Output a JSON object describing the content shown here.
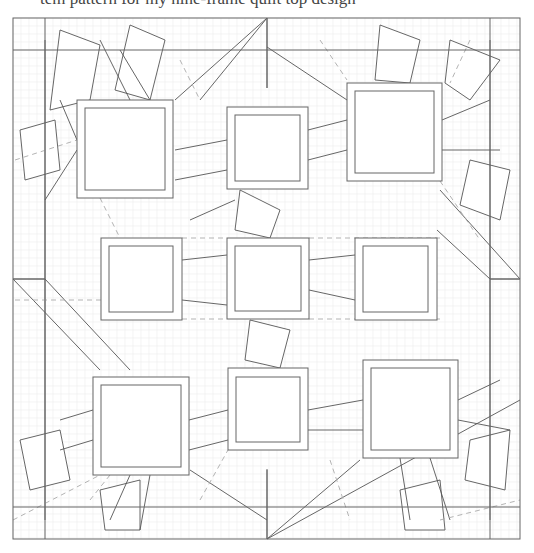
{
  "caption": "tem pattern for my nine-frame quilt top design",
  "frame": {
    "outer": [
      13,
      18,
      520,
      539
    ],
    "inner_v": [
      45,
      490
    ],
    "inner_h": [
      50,
      507
    ],
    "mid_h": 279,
    "mid_v": 267
  },
  "squares": [
    {
      "name": "top-left",
      "outer": [
        77,
        100,
        173,
        198
      ],
      "inner": [
        85,
        108,
        165,
        190
      ]
    },
    {
      "name": "top-middle",
      "outer": [
        227,
        107,
        308,
        189
      ],
      "inner": [
        235,
        115,
        300,
        181
      ]
    },
    {
      "name": "top-right",
      "outer": [
        347,
        83,
        442,
        181
      ],
      "inner": [
        355,
        91,
        434,
        173
      ]
    },
    {
      "name": "middle-left",
      "outer": [
        101,
        238,
        182,
        320
      ],
      "inner": [
        109,
        246,
        173,
        312
      ]
    },
    {
      "name": "center",
      "outer": [
        227,
        238,
        309,
        319
      ],
      "inner": [
        235,
        246,
        301,
        311
      ]
    },
    {
      "name": "middle-right",
      "outer": [
        355,
        238,
        437,
        320
      ],
      "inner": [
        363,
        246,
        428,
        312
      ]
    },
    {
      "name": "bottom-left",
      "outer": [
        93,
        377,
        189,
        475
      ],
      "inner": [
        101,
        385,
        181,
        467
      ]
    },
    {
      "name": "bottom-middle",
      "outer": [
        228,
        368,
        308,
        450
      ],
      "inner": [
        236,
        377,
        300,
        442
      ]
    },
    {
      "name": "bottom-right",
      "outer": [
        363,
        360,
        458,
        458
      ],
      "inner": [
        371,
        368,
        450,
        450
      ]
    }
  ],
  "lines": [
    [
      267,
      18,
      267,
      88
    ],
    [
      267,
      18,
      175,
      100
    ],
    [
      267,
      47,
      347,
      100
    ],
    [
      267,
      18,
      200,
      100
    ],
    [
      267,
      470,
      267,
      539
    ],
    [
      267,
      539,
      360,
      460
    ],
    [
      267,
      539,
      520,
      400
    ],
    [
      267,
      520,
      190,
      470
    ],
    [
      13,
      279,
      45,
      279
    ],
    [
      13,
      279,
      100,
      370
    ],
    [
      45,
      279,
      130,
      370
    ],
    [
      490,
      279,
      520,
      279
    ],
    [
      520,
      279,
      440,
      190
    ],
    [
      490,
      279,
      437,
      230
    ],
    [
      45,
      40,
      45,
      279
    ],
    [
      45,
      279,
      45,
      520
    ],
    [
      490,
      40,
      490,
      279
    ],
    [
      490,
      279,
      490,
      520
    ],
    [
      45,
      200,
      77,
      150
    ],
    [
      60,
      100,
      77,
      140
    ],
    [
      100,
      40,
      130,
      100
    ],
    [
      120,
      50,
      150,
      100
    ],
    [
      175,
      150,
      227,
      140
    ],
    [
      175,
      180,
      227,
      170
    ],
    [
      190,
      220,
      235,
      200
    ],
    [
      308,
      130,
      347,
      120
    ],
    [
      308,
      160,
      347,
      150
    ],
    [
      442,
      120,
      490,
      100
    ],
    [
      442,
      150,
      500,
      150
    ],
    [
      309,
      260,
      355,
      255
    ],
    [
      309,
      290,
      355,
      300
    ],
    [
      182,
      260,
      227,
      255
    ],
    [
      182,
      300,
      227,
      305
    ],
    [
      189,
      420,
      228,
      410
    ],
    [
      189,
      450,
      228,
      440
    ],
    [
      308,
      410,
      363,
      400
    ],
    [
      308,
      430,
      363,
      430
    ],
    [
      458,
      400,
      500,
      380
    ],
    [
      458,
      420,
      510,
      430
    ],
    [
      60,
      420,
      93,
      410
    ],
    [
      60,
      450,
      93,
      440
    ],
    [
      130,
      475,
      110,
      520
    ],
    [
      150,
      475,
      140,
      530
    ],
    [
      400,
      458,
      410,
      520
    ],
    [
      430,
      458,
      450,
      520
    ]
  ],
  "dashes": [
    [
      15,
      160,
      77,
      140
    ],
    [
      15,
      300,
      101,
      300
    ],
    [
      309,
      238,
      440,
      238
    ],
    [
      309,
      319,
      440,
      319
    ],
    [
      182,
      238,
      227,
      238
    ],
    [
      182,
      319,
      227,
      319
    ],
    [
      13,
      520,
      100,
      475
    ],
    [
      440,
      520,
      520,
      500
    ],
    [
      320,
      40,
      347,
      80
    ],
    [
      180,
      60,
      200,
      100
    ],
    [
      200,
      500,
      228,
      450
    ],
    [
      330,
      460,
      350,
      520
    ],
    [
      440,
      181,
      480,
      240
    ],
    [
      100,
      198,
      120,
      238
    ],
    [
      470,
      40,
      450,
      83
    ],
    [
      90,
      500,
      110,
      475
    ]
  ],
  "flaps": [
    [
      [
        60,
        30
      ],
      [
        100,
        45
      ],
      [
        90,
        100
      ],
      [
        50,
        110
      ]
    ],
    [
      [
        130,
        25
      ],
      [
        165,
        40
      ],
      [
        150,
        100
      ],
      [
        115,
        90
      ]
    ],
    [
      [
        20,
        130
      ],
      [
        55,
        120
      ],
      [
        60,
        170
      ],
      [
        25,
        180
      ]
    ],
    [
      [
        380,
        25
      ],
      [
        420,
        40
      ],
      [
        410,
        83
      ],
      [
        375,
        80
      ]
    ],
    [
      [
        450,
        40
      ],
      [
        500,
        60
      ],
      [
        470,
        100
      ],
      [
        445,
        83
      ]
    ],
    [
      [
        470,
        160
      ],
      [
        510,
        170
      ],
      [
        500,
        220
      ],
      [
        460,
        205
      ]
    ],
    [
      [
        20,
        440
      ],
      [
        60,
        430
      ],
      [
        70,
        480
      ],
      [
        30,
        490
      ]
    ],
    [
      [
        100,
        490
      ],
      [
        140,
        480
      ],
      [
        140,
        530
      ],
      [
        105,
        530
      ]
    ],
    [
      [
        400,
        490
      ],
      [
        440,
        480
      ],
      [
        445,
        530
      ],
      [
        405,
        530
      ]
    ],
    [
      [
        470,
        440
      ],
      [
        510,
        430
      ],
      [
        505,
        490
      ],
      [
        465,
        480
      ]
    ],
    [
      [
        240,
        190
      ],
      [
        280,
        210
      ],
      [
        270,
        238
      ],
      [
        235,
        230
      ]
    ],
    [
      [
        250,
        320
      ],
      [
        290,
        330
      ],
      [
        280,
        368
      ],
      [
        245,
        360
      ]
    ]
  ]
}
